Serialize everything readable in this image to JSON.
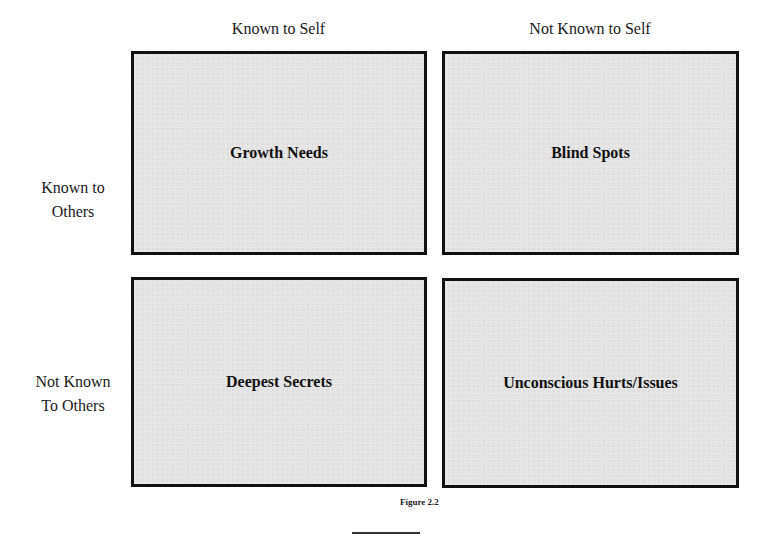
{
  "diagram": {
    "columns": [
      {
        "label": "Known to Self"
      },
      {
        "label": "Not Known to Self"
      }
    ],
    "rows": [
      {
        "label_line1": "Known to",
        "label_line2": "Others"
      },
      {
        "label_line1": "Not Known",
        "label_line2": "To Others"
      }
    ],
    "quadrants": [
      {
        "label": "Growth Needs"
      },
      {
        "label": "Blind Spots"
      },
      {
        "label": "Deepest Secrets"
      },
      {
        "label": "Unconscious Hurts/Issues"
      }
    ],
    "caption": "Figure 2.2",
    "colors": {
      "box_fill": "#e4e4e4",
      "box_border": "#111111",
      "text": "#111111"
    }
  }
}
